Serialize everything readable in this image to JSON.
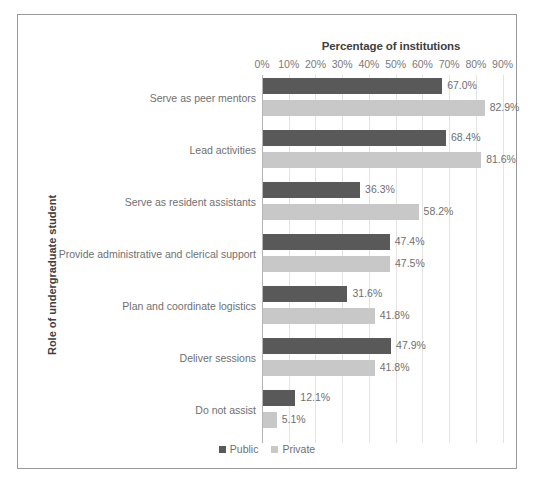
{
  "chart_data": {
    "type": "bar",
    "orientation": "horizontal",
    "title": "Percentage of institutions",
    "xlabel": "Percentage of institutions",
    "ylabel": "Role of undergraduate student",
    "xlim": [
      0,
      95
    ],
    "xticks": [
      "0%",
      "10%",
      "20%",
      "30%",
      "40%",
      "50%",
      "60%",
      "70%",
      "80%",
      "90%"
    ],
    "xtick_values": [
      0,
      10,
      20,
      30,
      40,
      50,
      60,
      70,
      80,
      90
    ],
    "grid": true,
    "legend_position": "bottom",
    "categories": [
      "Serve as peer mentors",
      "Lead activities",
      "Serve as resident assistants",
      "Provide administrative and clerical support",
      "Plan and coordinate logistics",
      "Deliver sessions",
      "Do not assist"
    ],
    "series": [
      {
        "name": "Public",
        "color": "#595959",
        "values": [
          67.0,
          68.4,
          36.3,
          47.4,
          31.6,
          47.9,
          12.1
        ],
        "labels": [
          "67.0%",
          "68.4%",
          "36.3%",
          "47.4%",
          "31.6%",
          "47.9%",
          "12.1%"
        ]
      },
      {
        "name": "Private",
        "color": "#c8c8c8",
        "values": [
          82.9,
          81.6,
          58.2,
          47.5,
          41.8,
          41.8,
          5.1
        ],
        "labels": [
          "82.9%",
          "81.6%",
          "58.2%",
          "47.5%",
          "41.8%",
          "41.8%",
          "5.1%"
        ]
      }
    ]
  },
  "colors": {
    "public": "#595959",
    "private": "#c8c8c8",
    "grid": "#e3e3e3",
    "frame": "#9a9a9a",
    "text": "#6f6f6f",
    "title_text": "#404040"
  }
}
